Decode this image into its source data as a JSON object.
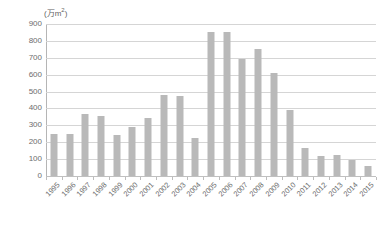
{
  "chart_data": {
    "type": "bar",
    "title": "",
    "subtitle": "",
    "xlabel": "",
    "ylabel": "(万m²)",
    "ylabel_unit_prefix": "(万m",
    "ylabel_unit_sup": "2",
    "ylabel_unit_suffix": ")",
    "ylim": [
      0,
      900
    ],
    "ytick_step": 100,
    "grid": true,
    "legend": "none",
    "bar_color": "#b9b9b9",
    "gridline_color": "#d5d5d5",
    "axis_color": "#b5b5b5",
    "text_color": "#6d6d6d",
    "yticks": [
      900,
      800,
      700,
      600,
      500,
      400,
      300,
      200,
      100,
      0
    ],
    "categories": [
      "1995",
      "1996",
      "1997",
      "1998",
      "1999",
      "2000",
      "2001",
      "2002",
      "2003",
      "2004",
      "2005",
      "2006",
      "2007",
      "2008",
      "2009",
      "2010",
      "2011",
      "2012",
      "2013",
      "2014",
      "2015"
    ],
    "values": [
      250,
      250,
      365,
      355,
      245,
      290,
      345,
      480,
      475,
      225,
      855,
      850,
      690,
      750,
      610,
      390,
      165,
      120,
      125,
      95,
      60
    ],
    "series": [
      {
        "name": "",
        "values": [
          250,
          250,
          365,
          355,
          245,
          290,
          345,
          480,
          475,
          225,
          855,
          850,
          690,
          750,
          610,
          390,
          165,
          120,
          125,
          95,
          60
        ]
      }
    ]
  }
}
